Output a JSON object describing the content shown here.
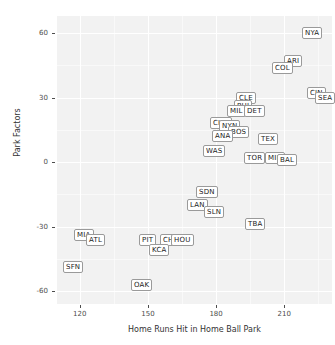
{
  "chart_data": {
    "type": "scatter",
    "title": "",
    "xlabel": "Home Runs Hit in Home Ball Park",
    "ylabel": "Park Factors",
    "xlim": [
      110,
      231
    ],
    "ylim": [
      -66,
      68
    ],
    "xticks": [
      120,
      150,
      180,
      210
    ],
    "yticks": [
      60,
      30,
      0,
      -30,
      -60
    ],
    "xtick_labels": [
      "120",
      "150",
      "180",
      "210"
    ],
    "ytick_labels": [
      "60",
      "30",
      "0",
      "-30",
      "-60"
    ],
    "grid": true,
    "legend": null,
    "marker": "text-label",
    "points": [
      {
        "label": "NYA",
        "x": 222,
        "y": 60
      },
      {
        "label": "ARI",
        "x": 214,
        "y": 47
      },
      {
        "label": "COL",
        "x": 209,
        "y": 44
      },
      {
        "label": "CIN",
        "x": 224,
        "y": 32
      },
      {
        "label": "SEA",
        "x": 228,
        "y": 30
      },
      {
        "label": "CLE",
        "x": 193,
        "y": 30
      },
      {
        "label": "PHI",
        "x": 192,
        "y": 26
      },
      {
        "label": "MIL",
        "x": 189,
        "y": 24
      },
      {
        "label": "DET",
        "x": 197,
        "y": 24
      },
      {
        "label": "CHA",
        "x": 182,
        "y": 18
      },
      {
        "label": "NYN",
        "x": 186,
        "y": 17
      },
      {
        "label": "BOS",
        "x": 190,
        "y": 14
      },
      {
        "label": "ANA",
        "x": 183,
        "y": 12
      },
      {
        "label": "TEX",
        "x": 203,
        "y": 11
      },
      {
        "label": "WAS",
        "x": 179,
        "y": 5
      },
      {
        "label": "TOR",
        "x": 197,
        "y": 2
      },
      {
        "label": "MIN",
        "x": 206,
        "y": 2
      },
      {
        "label": "BAL",
        "x": 211,
        "y": 1
      },
      {
        "label": "SDN",
        "x": 176,
        "y": -14
      },
      {
        "label": "LAN",
        "x": 172,
        "y": -20
      },
      {
        "label": "SLN",
        "x": 179,
        "y": -23
      },
      {
        "label": "TBA",
        "x": 197,
        "y": -29
      },
      {
        "label": "MIA",
        "x": 122,
        "y": -34
      },
      {
        "label": "ATL",
        "x": 127,
        "y": -36
      },
      {
        "label": "PIT",
        "x": 150,
        "y": -36
      },
      {
        "label": "CHN",
        "x": 160,
        "y": -36
      },
      {
        "label": "HOU",
        "x": 165,
        "y": -36
      },
      {
        "label": "KCA",
        "x": 155,
        "y": -41
      },
      {
        "label": "SFN",
        "x": 117,
        "y": -49
      },
      {
        "label": "OAK",
        "x": 147,
        "y": -57
      }
    ]
  }
}
